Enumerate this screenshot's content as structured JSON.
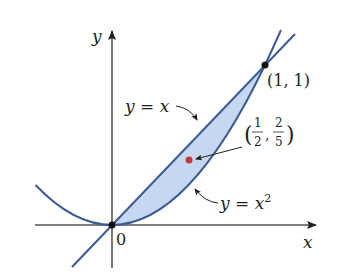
{
  "figure": {
    "axes": {
      "x_label": "x",
      "y_label": "y",
      "origin_label": "0"
    },
    "curves": [
      {
        "name": "line",
        "label": "y = x",
        "label_parts": [
          "y",
          " = ",
          "x"
        ]
      },
      {
        "name": "parabola",
        "label": "y = x²",
        "label_parts": [
          "y",
          " = ",
          "x",
          "2"
        ]
      }
    ],
    "points": {
      "intersection": {
        "label": "(1, 1)"
      },
      "centroid": {
        "label": "(1/2, 2/5)",
        "x_num": "1",
        "x_den": "2",
        "y_num": "2",
        "y_den": "5",
        "open_paren": "(",
        "comma": ",",
        "close_paren": ")"
      }
    },
    "colors": {
      "curve": "#3b5a94",
      "fill": "#c5d8ef",
      "axis": "#555555",
      "centroid_dot": "#c8363a",
      "point": "#111111"
    }
  }
}
